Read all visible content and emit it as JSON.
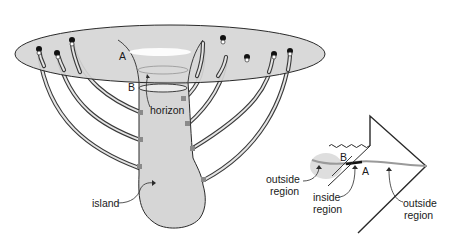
{
  "figure": {
    "left_diagram": {
      "labels": {
        "A": "A",
        "B": "B",
        "horizon": "horizon",
        "island": "island"
      }
    },
    "right_diagram": {
      "labels": {
        "B": "B",
        "A": "A",
        "outside_left": [
          "outside",
          "region"
        ],
        "inside": [
          "inside",
          "region"
        ],
        "outside_right": [
          "outside",
          "region"
        ]
      }
    },
    "colors": {
      "fill_gray": "#d6d6d6",
      "ink": "#2a2a2a",
      "tube_core": "#e4e4e4",
      "background": "#ffffff"
    }
  }
}
